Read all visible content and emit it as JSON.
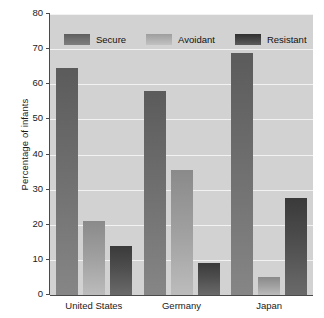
{
  "chart_data": {
    "type": "bar",
    "title": "",
    "xlabel": "",
    "ylabel": "Percentage of infants",
    "ylim": [
      0,
      80
    ],
    "yticks": [
      0,
      10,
      20,
      30,
      40,
      50,
      60,
      70,
      80
    ],
    "ytick_labels": [
      "0",
      "10",
      "20",
      "30",
      "40",
      "50",
      "60",
      "70",
      "80"
    ],
    "grid": true,
    "grid_color": "#f2f2f2",
    "plot_background": "#d2d2d2",
    "legend_position": "top-inside",
    "categories": [
      "United States",
      "Germany",
      "Japan"
    ],
    "series": [
      {
        "name": "Secure",
        "color": "#6e6e6e",
        "values": [
          64.5,
          58.0,
          69.0
        ]
      },
      {
        "name": "Avoidant",
        "color": "#a8a8a8",
        "values": [
          21.0,
          35.5,
          5.0
        ]
      },
      {
        "name": "Resistant",
        "color": "#454545",
        "values": [
          14.0,
          9.0,
          27.5
        ]
      }
    ]
  }
}
